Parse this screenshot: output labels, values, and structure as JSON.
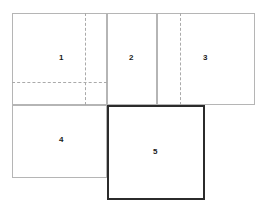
{
  "diagram": {
    "type": "rectangle-layout-diagram",
    "canvas": {
      "width": 266,
      "height": 210,
      "background": "#ffffff"
    },
    "styles": {
      "thin_border_color": "#b5b5b5",
      "emphasis_border_color": "#2b2b2b",
      "dashed_guide_color": "#aaaaaa",
      "label_color": "#1a1a1a"
    },
    "panels": [
      {
        "label": "1",
        "x": 12,
        "y": 13,
        "width": 95,
        "height": 92,
        "emphasis": false
      },
      {
        "label": "2",
        "x": 107,
        "y": 13,
        "width": 50,
        "height": 92,
        "emphasis": false
      },
      {
        "label": "3",
        "x": 157,
        "y": 13,
        "width": 98,
        "height": 92,
        "emphasis": false
      },
      {
        "label": "4",
        "x": 12,
        "y": 105,
        "width": 95,
        "height": 73,
        "emphasis": false
      },
      {
        "label": "5",
        "x": 107,
        "y": 105,
        "width": 98,
        "height": 95,
        "emphasis": true
      }
    ],
    "guides": [
      {
        "name": "vertical-guide-panel-1",
        "orientation": "vertical",
        "x": 85,
        "y": 13,
        "length": 92
      },
      {
        "name": "horizontal-guide-panel-1",
        "orientation": "horizontal",
        "x": 12,
        "y": 82,
        "length": 95
      },
      {
        "name": "vertical-guide-panel-3",
        "orientation": "vertical",
        "x": 180,
        "y": 13,
        "length": 92
      }
    ],
    "labels": [
      {
        "text": "1",
        "x": 59,
        "y": 54
      },
      {
        "text": "2",
        "x": 129,
        "y": 54
      },
      {
        "text": "3",
        "x": 203,
        "y": 54
      },
      {
        "text": "4",
        "x": 59,
        "y": 136
      },
      {
        "text": "5",
        "x": 153,
        "y": 148
      }
    ]
  }
}
